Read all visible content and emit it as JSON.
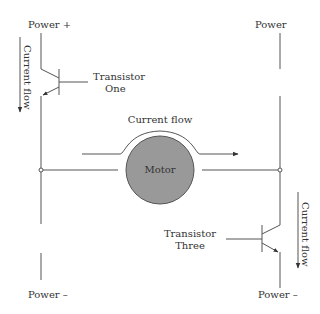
{
  "diagram": {
    "title": "",
    "labels": {
      "power_plus_left": "Power +",
      "power_right_top": "Power",
      "power_minus_left": "Power –",
      "power_minus_right": "Power –",
      "current_flow_left": "Current flow",
      "current_flow_center": "Current flow",
      "current_flow_right": "Current flow",
      "transistor_one_line1": "Transistor",
      "transistor_one_line2": "One",
      "transistor_three_line1": "Transistor",
      "transistor_three_line2": "Three",
      "motor": "Motor"
    },
    "colors": {
      "motor_fill": "#999999",
      "motor_stroke": "#555555",
      "wire": "#555555",
      "text": "#333333"
    }
  }
}
